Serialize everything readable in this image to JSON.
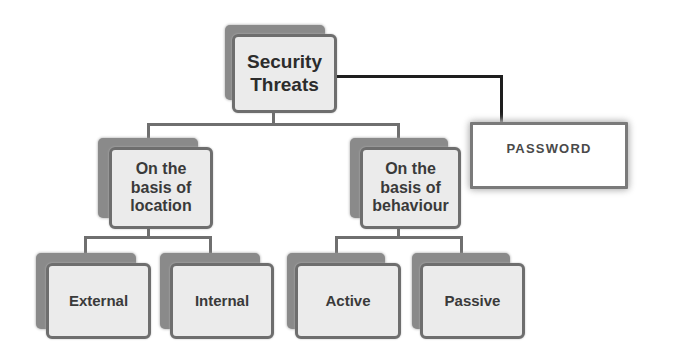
{
  "diagram": {
    "root": {
      "label_line1": "Security",
      "label_line2": "Threats"
    },
    "side": {
      "label": "PASSWORD"
    },
    "categories": [
      {
        "label_line1": "On the",
        "label_line2": "basis of",
        "label_line3": "location",
        "children": [
          {
            "label": "External"
          },
          {
            "label": "Internal"
          }
        ]
      },
      {
        "label_line1": "On the",
        "label_line2": "basis of",
        "label_line3": "behaviour",
        "children": [
          {
            "label": "Active"
          },
          {
            "label": "Passive"
          }
        ]
      }
    ]
  },
  "colors": {
    "box_fill": "#ebebeb",
    "box_border": "#6e6e6e",
    "box_shadow": "#8a8a8a",
    "connector": "#6f6f6f",
    "password_connector": "#1e1e1e"
  }
}
